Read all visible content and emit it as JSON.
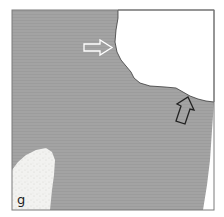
{
  "figure": {
    "panel_label": "g",
    "colors": {
      "tissue": "#a2a2a2",
      "background": "#ffffff",
      "frame": "#7a7a7a",
      "edge": "#3a3a3a",
      "hollow_arrow_light": "#ffffff",
      "hollow_arrow_dark": "#222222"
    },
    "annotations": [
      {
        "type": "arrow",
        "style": "hollow-white",
        "direction": "right",
        "points_to": "upper boundary indentation"
      },
      {
        "type": "arrow",
        "style": "hollow-black",
        "direction": "up",
        "points_to": "lower surface edge"
      }
    ]
  }
}
